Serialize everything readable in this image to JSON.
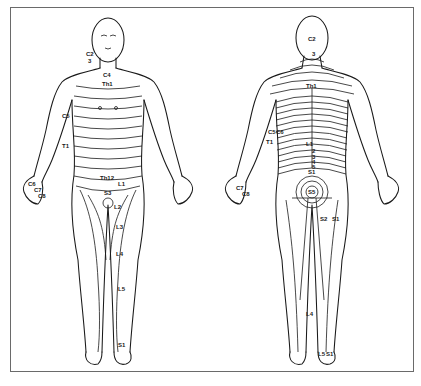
{
  "figure": {
    "views": [
      {
        "name": "anterior",
        "labels": {
          "neck_c2": "C2",
          "neck_c3": "3",
          "clavicle_c4": "C4",
          "chest_t2": "Th1",
          "arm_c5": "C5",
          "arm_t1": "T1",
          "hand_c6": "C6",
          "hand_c7": "C7",
          "hand_c8": "C8",
          "abdomen_t12": "Th12",
          "groin_l1": "L1",
          "perineum_s3": "S3",
          "thigh_l2": "L2",
          "thigh_l3": "L3",
          "knee_l4": "L4",
          "shin_l5": "L5",
          "foot_s1": "S1"
        }
      },
      {
        "name": "posterior",
        "labels": {
          "head_c2": "C2",
          "neck_c3": "3",
          "back_t1": "Th1",
          "lumbar_l1": "L1",
          "lumbar_2": "2",
          "lumbar_3": "3",
          "lumbar_4": "4",
          "lumbar_5": "5",
          "sacral_s1": "S1",
          "sacral_center": "S5",
          "thigh_s2": "S2",
          "thigh_s1": "S1",
          "arm_c5": "C5",
          "arm_c6": "C6",
          "arm_t1": "T1",
          "hand_c7": "C7",
          "hand_c8": "C8",
          "calf_l4": "L4",
          "foot_l5": "L5",
          "foot_s1": "S1"
        }
      }
    ]
  }
}
